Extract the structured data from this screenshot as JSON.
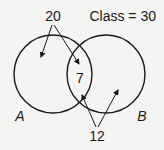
{
  "diagram": {
    "type": "venn",
    "title": "Class = 30",
    "sets": [
      {
        "name": "A",
        "label": "A"
      },
      {
        "name": "B",
        "label": "B"
      }
    ],
    "annotations": [
      {
        "value": "20",
        "points_to": [
          "A only",
          "A ∩ B"
        ]
      },
      {
        "value": "7",
        "region": "A ∩ B"
      },
      {
        "value": "12",
        "points_to": [
          "A ∩ B",
          "B only"
        ]
      }
    ]
  },
  "labels": {
    "class_total": "Class = 30",
    "set_a": "A",
    "set_b": "B",
    "top_count": "20",
    "intersection": "7",
    "bottom_count": "12"
  },
  "colors": {
    "background": "#f4f4f2",
    "stroke": "#1a1a1a"
  }
}
